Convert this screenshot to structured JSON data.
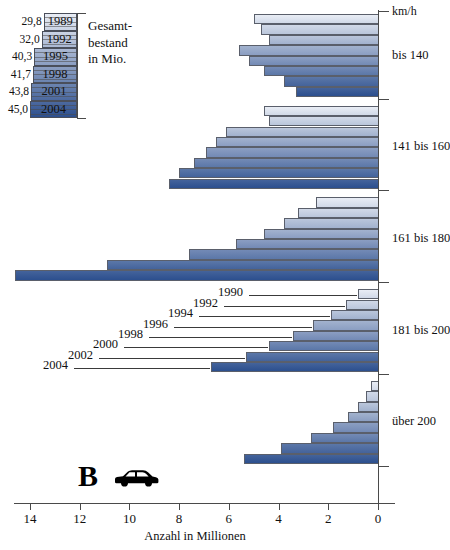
{
  "chart_data": {
    "type": "bar",
    "title": "",
    "orientation": "horizontal-right-to-left",
    "xlabel": "Anzahl in Millionen",
    "ylabel": "km/h",
    "xlim": [
      0,
      15.4
    ],
    "x_ticks": [
      14,
      12,
      10,
      8,
      6,
      4,
      2,
      0
    ],
    "x_tick_labels": [
      "14",
      "12",
      "10",
      "8",
      "6",
      "4",
      "2",
      "0"
    ],
    "grid": false,
    "legend_position": "inline-callouts",
    "categories": [
      "bis 140",
      "141 bis 160",
      "161 bis 180",
      "181 bis 200",
      "über 200"
    ],
    "series_name_label": "Jahr",
    "series": [
      {
        "name": "1990",
        "values": [
          5.0,
          4.6,
          2.5,
          0.8,
          0.3
        ]
      },
      {
        "name": "1992",
        "values": [
          4.7,
          4.4,
          3.2,
          1.3,
          0.5
        ]
      },
      {
        "name": "1994",
        "values": [
          4.4,
          6.1,
          3.8,
          1.9,
          0.8
        ]
      },
      {
        "name": "1996",
        "values": [
          5.6,
          6.5,
          4.6,
          2.6,
          1.2
        ]
      },
      {
        "name": "1998",
        "values": [
          5.2,
          6.9,
          5.7,
          3.4,
          1.8
        ]
      },
      {
        "name": "2000",
        "values": [
          4.6,
          7.4,
          7.6,
          4.4,
          2.7
        ]
      },
      {
        "name": "2002",
        "values": [
          3.8,
          8.0,
          10.9,
          5.3,
          3.9
        ]
      },
      {
        "name": "2004",
        "values": [
          3.3,
          8.4,
          14.6,
          6.7,
          5.4
        ]
      }
    ],
    "annotations": {
      "callout_group": "181 bis 200",
      "callout_years": [
        "1990",
        "1992",
        "1994",
        "1996",
        "1998",
        "2000",
        "2002",
        "2004"
      ]
    }
  },
  "axes": {
    "x_title": "Anzahl in Millionen",
    "unit_label": "km/h",
    "tick_labels": [
      "14",
      "12",
      "10",
      "8",
      "6",
      "4",
      "2",
      "0"
    ],
    "category_labels": [
      "bis 140",
      "141 bis 160",
      "161 bis 180",
      "181 bis 200",
      "über 200"
    ]
  },
  "inset": {
    "caption_line1": "Gesamt-",
    "caption_line2": "bestand",
    "caption_line3": "in Mio.",
    "type": "bar",
    "years": [
      "1989",
      "1992",
      "1995",
      "1998",
      "2001",
      "2004"
    ],
    "values": [
      "29,8",
      "32,0",
      "40,3",
      "41,7",
      "43,8",
      "45,0"
    ],
    "numeric_values": [
      29.8,
      32.0,
      40.3,
      41.7,
      43.8,
      45.0
    ]
  },
  "logo": {
    "letter": "B",
    "icon": "car-icon"
  },
  "colors": {
    "bar_light": "#e9edf5",
    "bar_dark": "#2c4f8e",
    "outline": "#5a5f6b",
    "axis": "#4a4a4a",
    "text": "#111111"
  }
}
